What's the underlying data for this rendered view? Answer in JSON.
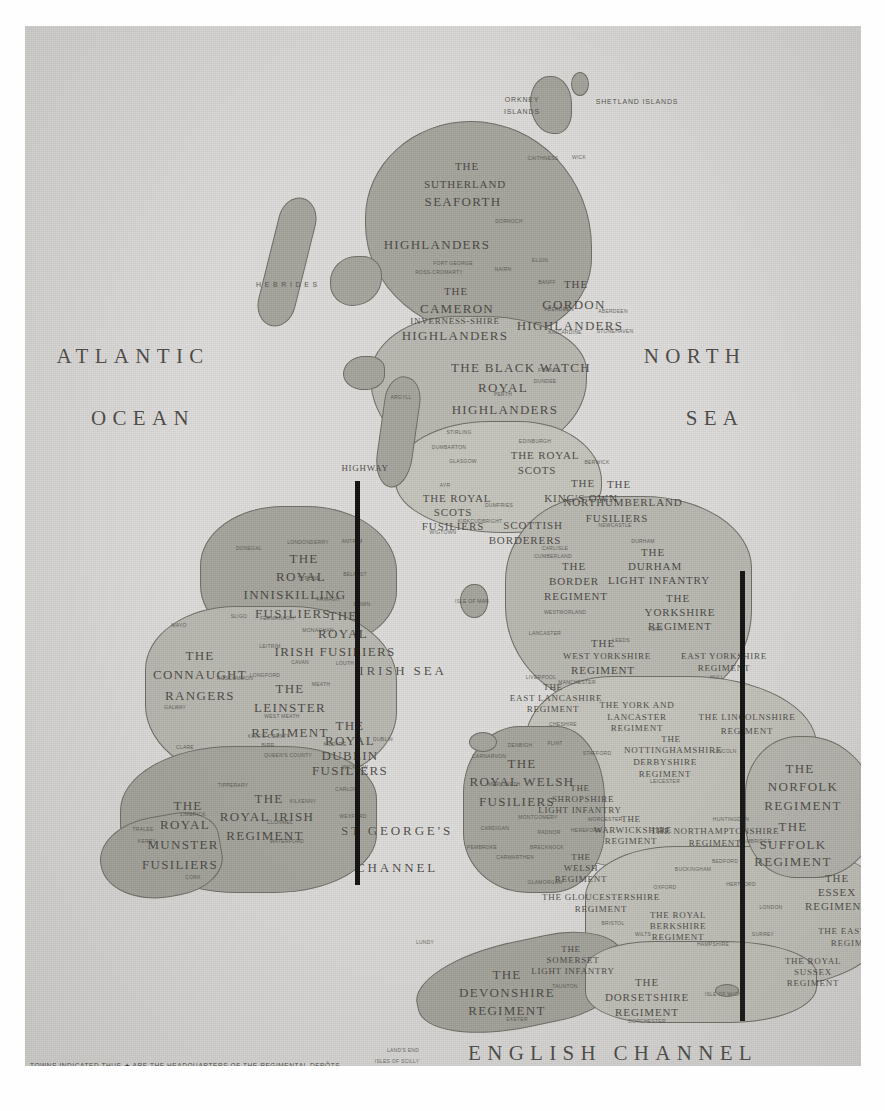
{
  "map": {
    "title": "Map of the British Isles showing Regimental Districts",
    "footnote": "TOWNS INDICATED THUS ★ ARE THE HEADQUARTERS OF THE REGIMENTAL DEPÔTS.",
    "paper_color": "#dcdcd8",
    "land_color": "#b9b8b1",
    "ink_color": "#3d3c38"
  },
  "sea_labels": [
    {
      "text": "ATLANTIC",
      "x": 108,
      "y": 318,
      "size": "lg"
    },
    {
      "text": "OCEAN",
      "x": 118,
      "y": 380,
      "size": "lg"
    },
    {
      "text": "NORTH",
      "x": 670,
      "y": 318,
      "size": "lg"
    },
    {
      "text": "SEA",
      "x": 690,
      "y": 380,
      "size": "lg"
    },
    {
      "text": "IRISH SEA",
      "x": 378,
      "y": 637,
      "size": "md"
    },
    {
      "text": "ST GEORGE'S",
      "x": 372,
      "y": 797,
      "size": "md"
    },
    {
      "text": "CHANNEL",
      "x": 372,
      "y": 834,
      "size": "md"
    },
    {
      "text": "ENGLISH  CHANNEL",
      "x": 588,
      "y": 1015,
      "size": "lg"
    }
  ],
  "island_labels": [
    {
      "text": "ORKNEY",
      "x": 497,
      "y": 70
    },
    {
      "text": "ISLANDS",
      "x": 497,
      "y": 82
    },
    {
      "text": "SHETLAND ISLANDS",
      "x": 612,
      "y": 72
    },
    {
      "text": "H E B R I D E S",
      "x": 262,
      "y": 255
    }
  ],
  "regiments": [
    {
      "name": "THE",
      "x": 442,
      "y": 134,
      "size": "m"
    },
    {
      "name": "SUTHERLAND",
      "x": 440,
      "y": 152,
      "size": "m"
    },
    {
      "name": "SEAFORTH",
      "x": 438,
      "y": 168,
      "size": "l"
    },
    {
      "name": "HIGHLANDERS",
      "x": 412,
      "y": 211,
      "size": "l"
    },
    {
      "name": "THE",
      "x": 431,
      "y": 259,
      "size": "m"
    },
    {
      "name": "CAMERON",
      "x": 432,
      "y": 275,
      "size": "l"
    },
    {
      "name": "INVERNESS-SHIRE",
      "x": 430,
      "y": 290,
      "size": "s"
    },
    {
      "name": "HIGHLANDERS",
      "x": 430,
      "y": 302,
      "size": "l"
    },
    {
      "name": "THE",
      "x": 551,
      "y": 252,
      "size": "m"
    },
    {
      "name": "GORDON",
      "x": 549,
      "y": 271,
      "size": "l"
    },
    {
      "name": "HIGHLANDERS",
      "x": 545,
      "y": 292,
      "size": "l"
    },
    {
      "name": "THE BLACK WATCH",
      "x": 496,
      "y": 334,
      "size": "l"
    },
    {
      "name": "ROYAL",
      "x": 478,
      "y": 354,
      "size": "l"
    },
    {
      "name": "HIGHLANDERS",
      "x": 480,
      "y": 376,
      "size": "l"
    },
    {
      "name": "THE ROYAL",
      "x": 520,
      "y": 423,
      "size": "m"
    },
    {
      "name": "SCOTS",
      "x": 512,
      "y": 438,
      "size": "m"
    },
    {
      "name": "THE",
      "x": 558,
      "y": 451,
      "size": "m"
    },
    {
      "name": "KING'S OWN",
      "x": 556,
      "y": 466,
      "size": "m"
    },
    {
      "name": "SCOTTISH",
      "x": 508,
      "y": 493,
      "size": "m"
    },
    {
      "name": "BORDERERS",
      "x": 500,
      "y": 508,
      "size": "m"
    },
    {
      "name": "THE ROYAL",
      "x": 432,
      "y": 466,
      "size": "m"
    },
    {
      "name": "SCOTS",
      "x": 428,
      "y": 480,
      "size": "m"
    },
    {
      "name": "FUSILIERS",
      "x": 428,
      "y": 494,
      "size": "m"
    },
    {
      "name": "HIGHWAY",
      "x": 340,
      "y": 437,
      "size": "s"
    },
    {
      "name": "THE",
      "x": 594,
      "y": 452,
      "size": "m"
    },
    {
      "name": "NORTHUMBERLAND",
      "x": 598,
      "y": 470,
      "size": "m"
    },
    {
      "name": "FUSILIERS",
      "x": 592,
      "y": 486,
      "size": "m"
    },
    {
      "name": "THE",
      "x": 628,
      "y": 520,
      "size": "m"
    },
    {
      "name": "DURHAM",
      "x": 630,
      "y": 534,
      "size": "m"
    },
    {
      "name": "LIGHT INFANTRY",
      "x": 634,
      "y": 548,
      "size": "m"
    },
    {
      "name": "THE",
      "x": 549,
      "y": 534,
      "size": "m"
    },
    {
      "name": "BORDER",
      "x": 549,
      "y": 549,
      "size": "m"
    },
    {
      "name": "REGIMENT",
      "x": 551,
      "y": 564,
      "size": "m"
    },
    {
      "name": "THE",
      "x": 653,
      "y": 566,
      "size": "m"
    },
    {
      "name": "YORKSHIRE",
      "x": 655,
      "y": 580,
      "size": "m"
    },
    {
      "name": "REGIMENT",
      "x": 655,
      "y": 594,
      "size": "m"
    },
    {
      "name": "THE",
      "x": 578,
      "y": 611,
      "size": "m"
    },
    {
      "name": "WEST YORKSHIRE",
      "x": 582,
      "y": 625,
      "size": "s"
    },
    {
      "name": "REGIMENT",
      "x": 578,
      "y": 638,
      "size": "m"
    },
    {
      "name": "EAST YORKSHIRE",
      "x": 699,
      "y": 625,
      "size": "s"
    },
    {
      "name": "REGIMENT",
      "x": 699,
      "y": 637,
      "size": "s"
    },
    {
      "name": "THE",
      "x": 528,
      "y": 656,
      "size": "s"
    },
    {
      "name": "EAST LANCASHIRE",
      "x": 531,
      "y": 667,
      "size": "s"
    },
    {
      "name": "REGIMENT",
      "x": 528,
      "y": 678,
      "size": "s"
    },
    {
      "name": "THE YORK AND",
      "x": 612,
      "y": 674,
      "size": "s"
    },
    {
      "name": "LANCASTER",
      "x": 612,
      "y": 686,
      "size": "s"
    },
    {
      "name": "REGIMENT",
      "x": 612,
      "y": 697,
      "size": "s"
    },
    {
      "name": "THE LINCOLNSHIRE",
      "x": 722,
      "y": 686,
      "size": "s"
    },
    {
      "name": "REGIMENT",
      "x": 722,
      "y": 700,
      "size": "s"
    },
    {
      "name": "THE",
      "x": 646,
      "y": 708,
      "size": "s"
    },
    {
      "name": "NOTTINGHAMSHIRE",
      "x": 648,
      "y": 719,
      "size": "s"
    },
    {
      "name": "DERBYSHIRE",
      "x": 640,
      "y": 731,
      "size": "s"
    },
    {
      "name": "REGIMENT",
      "x": 640,
      "y": 743,
      "size": "s"
    },
    {
      "name": "THE",
      "x": 775,
      "y": 735,
      "size": "l"
    },
    {
      "name": "NORFOLK",
      "x": 778,
      "y": 753,
      "size": "l"
    },
    {
      "name": "REGIMENT",
      "x": 778,
      "y": 772,
      "size": "l"
    },
    {
      "name": "THE",
      "x": 768,
      "y": 793,
      "size": "l"
    },
    {
      "name": "SUFFOLK",
      "x": 768,
      "y": 811,
      "size": "l"
    },
    {
      "name": "REGIMENT",
      "x": 768,
      "y": 828,
      "size": "l"
    },
    {
      "name": "THE",
      "x": 812,
      "y": 846,
      "size": "m"
    },
    {
      "name": "ESSEX",
      "x": 812,
      "y": 860,
      "size": "m"
    },
    {
      "name": "REGIMENT",
      "x": 812,
      "y": 874,
      "size": "m"
    },
    {
      "name": "THE",
      "x": 497,
      "y": 730,
      "size": "l"
    },
    {
      "name": "ROYAL WELSH",
      "x": 497,
      "y": 748,
      "size": "l"
    },
    {
      "name": "FUSILIERS",
      "x": 492,
      "y": 768,
      "size": "l"
    },
    {
      "name": "THE",
      "x": 555,
      "y": 757,
      "size": "s"
    },
    {
      "name": "SHROPSHIRE",
      "x": 558,
      "y": 768,
      "size": "s"
    },
    {
      "name": "LIGHT INFANTRY",
      "x": 555,
      "y": 779,
      "size": "s"
    },
    {
      "name": "THE",
      "x": 606,
      "y": 788,
      "size": "s"
    },
    {
      "name": "WARWICKSHIRE",
      "x": 608,
      "y": 799,
      "size": "s"
    },
    {
      "name": "REGIMENT",
      "x": 606,
      "y": 810,
      "size": "s"
    },
    {
      "name": "THE NORTHAMPTONSHIRE",
      "x": 690,
      "y": 800,
      "size": "s"
    },
    {
      "name": "REGIMENT",
      "x": 690,
      "y": 812,
      "size": "s"
    },
    {
      "name": "THE",
      "x": 556,
      "y": 826,
      "size": "s"
    },
    {
      "name": "WELSH",
      "x": 556,
      "y": 837,
      "size": "s"
    },
    {
      "name": "REGIMENT",
      "x": 556,
      "y": 848,
      "size": "s"
    },
    {
      "name": "THE GLOUCESTERSHIRE",
      "x": 576,
      "y": 866,
      "size": "s"
    },
    {
      "name": "REGIMENT",
      "x": 576,
      "y": 878,
      "size": "s"
    },
    {
      "name": "THE ROYAL",
      "x": 653,
      "y": 884,
      "size": "s"
    },
    {
      "name": "BERKSHIRE",
      "x": 653,
      "y": 895,
      "size": "s"
    },
    {
      "name": "REGIMENT",
      "x": 653,
      "y": 906,
      "size": "s"
    },
    {
      "name": "THE ROYAL",
      "x": 788,
      "y": 930,
      "size": "s"
    },
    {
      "name": "SUSSEX",
      "x": 788,
      "y": 941,
      "size": "s"
    },
    {
      "name": "REGIMENT",
      "x": 788,
      "y": 952,
      "size": "s"
    },
    {
      "name": "THE EAST KENT",
      "x": 832,
      "y": 900,
      "size": "s"
    },
    {
      "name": "REGIMENT",
      "x": 832,
      "y": 912,
      "size": "s"
    },
    {
      "name": "THE",
      "x": 546,
      "y": 918,
      "size": "s"
    },
    {
      "name": "SOMERSET",
      "x": 548,
      "y": 929,
      "size": "s"
    },
    {
      "name": "LIGHT INFANTRY",
      "x": 548,
      "y": 940,
      "size": "s"
    },
    {
      "name": "THE",
      "x": 482,
      "y": 941,
      "size": "l"
    },
    {
      "name": "DEVONSHIRE",
      "x": 482,
      "y": 959,
      "size": "l"
    },
    {
      "name": "REGIMENT",
      "x": 482,
      "y": 977,
      "size": "l"
    },
    {
      "name": "THE",
      "x": 622,
      "y": 950,
      "size": "m"
    },
    {
      "name": "DORSETSHIRE",
      "x": 622,
      "y": 965,
      "size": "m"
    },
    {
      "name": "REGIMENT",
      "x": 622,
      "y": 980,
      "size": "m"
    },
    {
      "name": "THE",
      "x": 279,
      "y": 525,
      "size": "l"
    },
    {
      "name": "ROYAL",
      "x": 276,
      "y": 543,
      "size": "l"
    },
    {
      "name": "INNISKILLING",
      "x": 270,
      "y": 561,
      "size": "l"
    },
    {
      "name": "FUSILIERS",
      "x": 268,
      "y": 580,
      "size": "l"
    },
    {
      "name": "THE",
      "x": 318,
      "y": 582,
      "size": "l"
    },
    {
      "name": "ROYAL",
      "x": 318,
      "y": 600,
      "size": "l"
    },
    {
      "name": "IRISH FUSILIERS",
      "x": 310,
      "y": 618,
      "size": "l"
    },
    {
      "name": "THE",
      "x": 175,
      "y": 622,
      "size": "l"
    },
    {
      "name": "CONNAUGHT",
      "x": 175,
      "y": 641,
      "size": "l"
    },
    {
      "name": "RANGERS",
      "x": 175,
      "y": 662,
      "size": "l"
    },
    {
      "name": "THE",
      "x": 265,
      "y": 655,
      "size": "l"
    },
    {
      "name": "LEINSTER",
      "x": 265,
      "y": 674,
      "size": "l"
    },
    {
      "name": "REGIMENT",
      "x": 265,
      "y": 699,
      "size": "l"
    },
    {
      "name": "THE",
      "x": 325,
      "y": 692,
      "size": "l"
    },
    {
      "name": "ROYAL",
      "x": 325,
      "y": 707,
      "size": "l"
    },
    {
      "name": "DUBLIN",
      "x": 325,
      "y": 722,
      "size": "l"
    },
    {
      "name": "FUSILIERS",
      "x": 325,
      "y": 737,
      "size": "l"
    },
    {
      "name": "THE",
      "x": 244,
      "y": 765,
      "size": "l"
    },
    {
      "name": "ROYAL IRISH",
      "x": 242,
      "y": 783,
      "size": "l"
    },
    {
      "name": "REGIMENT",
      "x": 240,
      "y": 802,
      "size": "l"
    },
    {
      "name": "THE",
      "x": 163,
      "y": 772,
      "size": "l"
    },
    {
      "name": "ROYAL",
      "x": 160,
      "y": 791,
      "size": "l"
    },
    {
      "name": "MUNSTER",
      "x": 158,
      "y": 811,
      "size": "l"
    },
    {
      "name": "FUSILIERS",
      "x": 155,
      "y": 831,
      "size": "l"
    }
  ],
  "counties": [
    {
      "text": "CAITHNESS",
      "x": 518,
      "y": 129
    },
    {
      "text": "WICK",
      "x": 554,
      "y": 128
    },
    {
      "text": "DORNOCH",
      "x": 484,
      "y": 192
    },
    {
      "text": "ELGIN",
      "x": 515,
      "y": 231
    },
    {
      "text": "FORT GEORGE",
      "x": 428,
      "y": 234
    },
    {
      "text": "ROSS-CROMARTY",
      "x": 414,
      "y": 243
    },
    {
      "text": "NAIRN",
      "x": 478,
      "y": 240
    },
    {
      "text": "BANFF",
      "x": 522,
      "y": 253
    },
    {
      "text": "ABERDEEN",
      "x": 534,
      "y": 280
    },
    {
      "text": "ABERDEEN",
      "x": 588,
      "y": 282
    },
    {
      "text": "STONEHAVEN",
      "x": 590,
      "y": 302
    },
    {
      "text": "KINCARDINE",
      "x": 540,
      "y": 303
    },
    {
      "text": "PERTH",
      "x": 478,
      "y": 365
    },
    {
      "text": "FORFAR",
      "x": 524,
      "y": 341
    },
    {
      "text": "DUNDEE",
      "x": 520,
      "y": 352
    },
    {
      "text": "ARGYLL",
      "x": 376,
      "y": 368
    },
    {
      "text": "STIRLING",
      "x": 434,
      "y": 403
    },
    {
      "text": "DUMBARTON",
      "x": 424,
      "y": 418
    },
    {
      "text": "EDINBURGH",
      "x": 510,
      "y": 412
    },
    {
      "text": "GLASGOW",
      "x": 438,
      "y": 432
    },
    {
      "text": "AYR",
      "x": 420,
      "y": 456
    },
    {
      "text": "BERWICK",
      "x": 572,
      "y": 433
    },
    {
      "text": "DUMFRIES",
      "x": 474,
      "y": 476
    },
    {
      "text": "KIRKCUDBRIGHT",
      "x": 455,
      "y": 492
    },
    {
      "text": "WIGTOWN",
      "x": 418,
      "y": 503
    },
    {
      "text": "NEWCASTLE",
      "x": 590,
      "y": 496
    },
    {
      "text": "CARLISLE",
      "x": 530,
      "y": 519
    },
    {
      "text": "CUMBERLAND",
      "x": 528,
      "y": 527
    },
    {
      "text": "DURHAM",
      "x": 618,
      "y": 512
    },
    {
      "text": "WESTMORLAND",
      "x": 540,
      "y": 583
    },
    {
      "text": "LANCASTER",
      "x": 520,
      "y": 604
    },
    {
      "text": "YORK",
      "x": 630,
      "y": 600
    },
    {
      "text": "LEEDS",
      "x": 596,
      "y": 611
    },
    {
      "text": "HULL",
      "x": 692,
      "y": 648
    },
    {
      "text": "ISLE OF MAN",
      "x": 447,
      "y": 572
    },
    {
      "text": "MANCHESTER",
      "x": 552,
      "y": 653
    },
    {
      "text": "LIVERPOOL",
      "x": 516,
      "y": 648
    },
    {
      "text": "CHESHIRE",
      "x": 538,
      "y": 695
    },
    {
      "text": "LINCOLN",
      "x": 700,
      "y": 722
    },
    {
      "text": "STAFFORD",
      "x": 572,
      "y": 724
    },
    {
      "text": "LEICESTER",
      "x": 640,
      "y": 752
    },
    {
      "text": "DENBIGH",
      "x": 495,
      "y": 716
    },
    {
      "text": "FLINT",
      "x": 530,
      "y": 714
    },
    {
      "text": "CARNARVON",
      "x": 464,
      "y": 727
    },
    {
      "text": "MERIONETH",
      "x": 479,
      "y": 755
    },
    {
      "text": "MONTGOMERY",
      "x": 513,
      "y": 788
    },
    {
      "text": "CARDIGAN",
      "x": 470,
      "y": 799
    },
    {
      "text": "RADNOR",
      "x": 524,
      "y": 803
    },
    {
      "text": "BRECKNOCK",
      "x": 522,
      "y": 818
    },
    {
      "text": "PEMBROKE",
      "x": 457,
      "y": 818
    },
    {
      "text": "CARMARTHEN",
      "x": 490,
      "y": 828
    },
    {
      "text": "GLAMORGAN",
      "x": 520,
      "y": 853
    },
    {
      "text": "HEREFORD",
      "x": 561,
      "y": 801
    },
    {
      "text": "WORCESTER",
      "x": 580,
      "y": 790
    },
    {
      "text": "OXFORD",
      "x": 640,
      "y": 858
    },
    {
      "text": "BUCKINGHAM",
      "x": 668,
      "y": 840
    },
    {
      "text": "BEDFORD",
      "x": 700,
      "y": 832
    },
    {
      "text": "HERTFORD",
      "x": 716,
      "y": 855
    },
    {
      "text": "CAMBRIDGE",
      "x": 730,
      "y": 812
    },
    {
      "text": "HUNTINGDON",
      "x": 706,
      "y": 790
    },
    {
      "text": "LONDON",
      "x": 746,
      "y": 878
    },
    {
      "text": "SURREY",
      "x": 738,
      "y": 905
    },
    {
      "text": "HAMPSHIRE",
      "x": 688,
      "y": 915
    },
    {
      "text": "WILTS",
      "x": 618,
      "y": 905
    },
    {
      "text": "BRISTOL",
      "x": 588,
      "y": 894
    },
    {
      "text": "EXETER",
      "x": 492,
      "y": 990
    },
    {
      "text": "TAUNTON",
      "x": 540,
      "y": 957
    },
    {
      "text": "DORCHESTER",
      "x": 622,
      "y": 992
    },
    {
      "text": "LAND'S END",
      "x": 378,
      "y": 1021
    },
    {
      "text": "ISLES OF SCILLY",
      "x": 372,
      "y": 1032
    },
    {
      "text": "LUNDY",
      "x": 400,
      "y": 913
    },
    {
      "text": "ISLE OF WIGHT",
      "x": 700,
      "y": 965
    },
    {
      "text": "LONDONDERRY",
      "x": 283,
      "y": 513
    },
    {
      "text": "DONEGAL",
      "x": 224,
      "y": 519
    },
    {
      "text": "ANTRIM",
      "x": 327,
      "y": 512
    },
    {
      "text": "BELFAST",
      "x": 330,
      "y": 545
    },
    {
      "text": "TYRONE",
      "x": 284,
      "y": 549
    },
    {
      "text": "ARMAGH",
      "x": 303,
      "y": 570
    },
    {
      "text": "DOWN",
      "x": 337,
      "y": 575
    },
    {
      "text": "FERMANAGH",
      "x": 252,
      "y": 589
    },
    {
      "text": "MONAGHAN",
      "x": 293,
      "y": 601
    },
    {
      "text": "MAYO",
      "x": 154,
      "y": 596
    },
    {
      "text": "SLIGO",
      "x": 214,
      "y": 587
    },
    {
      "text": "LEITRIM",
      "x": 245,
      "y": 617
    },
    {
      "text": "CAVAN",
      "x": 275,
      "y": 633
    },
    {
      "text": "LOUTH",
      "x": 320,
      "y": 634
    },
    {
      "text": "LONGFORD",
      "x": 240,
      "y": 646
    },
    {
      "text": "ROSCOMMON",
      "x": 210,
      "y": 649
    },
    {
      "text": "MEATH",
      "x": 296,
      "y": 655
    },
    {
      "text": "WEST MEATH",
      "x": 257,
      "y": 687
    },
    {
      "text": "GALWAY",
      "x": 150,
      "y": 678
    },
    {
      "text": "KING'S COUNTY",
      "x": 244,
      "y": 707
    },
    {
      "text": "QUEEN'S COUNTY",
      "x": 263,
      "y": 726
    },
    {
      "text": "BIRR",
      "x": 243,
      "y": 716
    },
    {
      "text": "KILDARE",
      "x": 310,
      "y": 715
    },
    {
      "text": "DUBLIN",
      "x": 358,
      "y": 710
    },
    {
      "text": "WICKLOW",
      "x": 330,
      "y": 738
    },
    {
      "text": "CLARE",
      "x": 160,
      "y": 718
    },
    {
      "text": "TIPPERARY",
      "x": 208,
      "y": 756
    },
    {
      "text": "KILKENNY",
      "x": 278,
      "y": 772
    },
    {
      "text": "CARLOW",
      "x": 322,
      "y": 760
    },
    {
      "text": "WEXFORD",
      "x": 328,
      "y": 787
    },
    {
      "text": "LIMERICK",
      "x": 168,
      "y": 785
    },
    {
      "text": "CLONMEL",
      "x": 255,
      "y": 793
    },
    {
      "text": "WATERFORD",
      "x": 262,
      "y": 812
    },
    {
      "text": "KERRY",
      "x": 122,
      "y": 812
    },
    {
      "text": "CORK",
      "x": 168,
      "y": 848
    },
    {
      "text": "TRALEE",
      "x": 118,
      "y": 800
    }
  ],
  "artifact_bars": [
    {
      "x": 330,
      "y": 455,
      "width": 5,
      "height": 404
    },
    {
      "x": 715,
      "y": 545,
      "width": 5,
      "height": 450
    }
  ]
}
